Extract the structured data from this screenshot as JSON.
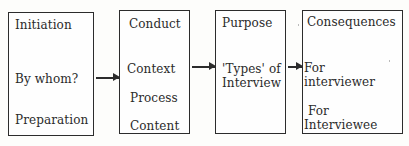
{
  "diagram": {
    "boxes": [
      {
        "title": "Initiation",
        "items": [
          "By whom?",
          "Preparation"
        ]
      },
      {
        "title": "Conduct",
        "items": [
          "Context",
          "Process",
          "Content"
        ]
      },
      {
        "title": "Purpose",
        "items": [
          "'Types' of",
          "Interview"
        ]
      },
      {
        "title": "Consequences",
        "items": [
          "For",
          "interviewer",
          "For",
          "Interviewee"
        ]
      }
    ],
    "arrows": [
      {
        "from": "Initiation",
        "to": "Conduct"
      },
      {
        "from": "Conduct",
        "to": "Purpose"
      },
      {
        "from": "Purpose",
        "to": "Consequences"
      }
    ]
  }
}
